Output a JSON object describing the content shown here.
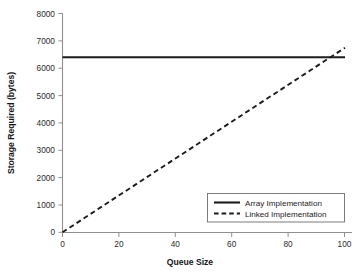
{
  "chart_data": {
    "type": "line",
    "title": "",
    "xlabel": "Queue Size",
    "ylabel": "Storage Required (bytes)",
    "xlim": [
      0,
      100
    ],
    "ylim": [
      0,
      8000
    ],
    "xticks": [
      0,
      20,
      40,
      60,
      80,
      100
    ],
    "yticks": [
      0,
      1000,
      2000,
      3000,
      4000,
      5000,
      6000,
      7000,
      8000
    ],
    "xtick_labels": [
      "0",
      "20",
      "40",
      "60",
      "80",
      "100"
    ],
    "ytick_labels": [
      "0",
      "1000",
      "2000",
      "3000",
      "4000",
      "5000",
      "6000",
      "7000",
      "8000"
    ],
    "grid": false,
    "legend_position": "lower right",
    "series": [
      {
        "name": "Array Implementation",
        "style": "solid",
        "color": "#1c1c1c",
        "x": [
          0,
          100
        ],
        "values": [
          6400,
          6400
        ]
      },
      {
        "name": "Linked Implementation",
        "style": "dashed",
        "color": "#1c1c1c",
        "x": [
          0,
          100
        ],
        "values": [
          0,
          6750
        ]
      }
    ],
    "annotations": [
      {
        "text": "lines intersect near Queue Size 95",
        "x": 95,
        "y": 6400
      }
    ]
  },
  "legend": {
    "entries": [
      {
        "label": "Array Implementation",
        "style": "solid"
      },
      {
        "label": "Linked Implementation",
        "style": "dashed"
      }
    ]
  }
}
